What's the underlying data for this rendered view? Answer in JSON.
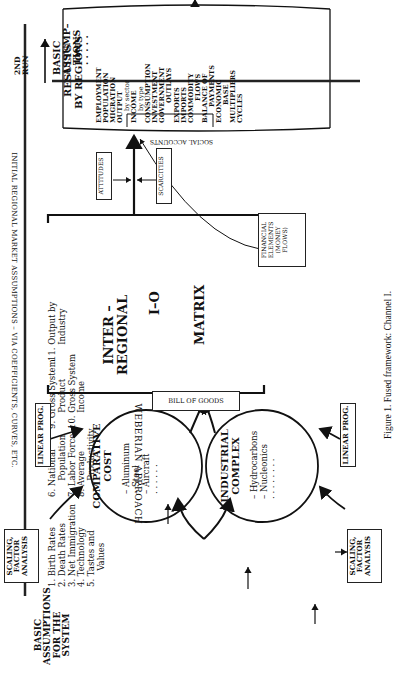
{
  "figure": {
    "caption": "Figure 1.   Fused framework: Channel I."
  },
  "basic_assumptions": {
    "title_lines": [
      "BASIC",
      "ASSUMPTIONS",
      "FOR THE SYSTEM"
    ],
    "groups": [
      [
        "1. Birth Rates",
        "2. Death Rates",
        "3. Net Immigration",
        "4. Technology",
        "5. Tastes and",
        "      Values"
      ],
      [
        "6. National",
        "      Population",
        "7. Labor Force",
        "8. Average",
        "      Productivity"
      ],
      [
        "9. Gross System",
        "      Product",
        "10. Gross System",
        "      Income"
      ],
      [
        "11. Output by",
        "      Industry"
      ]
    ]
  },
  "market_banner": "INITIAL REGIONAL MARKET ASSUMPTIONS – VIA COEFFICIENTS, CURVES, ETC.",
  "weberian": "WEBERIAN APPROACH",
  "scaling_box": {
    "lines": [
      "SCALING,",
      "FACTOR",
      "ANALYSIS"
    ]
  },
  "linear_prog_box": {
    "label": "LINEAR PROG."
  },
  "comparative_cost": {
    "title_lines": [
      "COMPARATIVE",
      "COST"
    ],
    "items": [
      "– Aluminum",
      "– Steel",
      "– Aircraft",
      "· · · · · ·"
    ]
  },
  "industrial_complex": {
    "title_lines": [
      "INDUSTRIAL",
      "COMPLEX"
    ],
    "items": [
      "– Hydrocarbons",
      "– Nucleonics",
      "· · · · · · · ·"
    ]
  },
  "bill_of_goods": "BILL OF GOODS",
  "io_matrix": {
    "lines": [
      "INTER –",
      "REGIONAL",
      "I–O",
      "MATRIX"
    ]
  },
  "financial_box": {
    "lines": [
      "FINANCIAL",
      "ELEMENTS",
      "(MONEY",
      "FLOWS)"
    ]
  },
  "attitudes": "ATTITUDES",
  "scarcities": "SCARCITIES",
  "results": {
    "title_lines": [
      "RESULTS",
      "BY REGIONS"
    ],
    "items": [
      "EMPLOYMENT",
      "POPULATION",
      "MIGRATION",
      "OUTPUT",
      "by sector",
      "INCOME",
      "by type",
      "CONSUMPTION",
      "INVESTMENT",
      "GOVERNMENT",
      "OUTLAYS",
      "EXPORTS",
      "IMPORTS",
      "COMMODITY",
      "FLOWS",
      "BALANCE OF",
      "PAYMENTS",
      "ECONOMIC",
      "BASE",
      "MULTIPLIERS",
      "CYCLES"
    ],
    "social_accounts": "SOCIAL ACCOUNTS"
  },
  "second_run": {
    "arrow_label_lines": [
      "2ND",
      "RUN"
    ],
    "box_lines": [
      "BASIC",
      "ASSUMP–",
      "TIONS",
      "· · · · ·"
    ]
  }
}
